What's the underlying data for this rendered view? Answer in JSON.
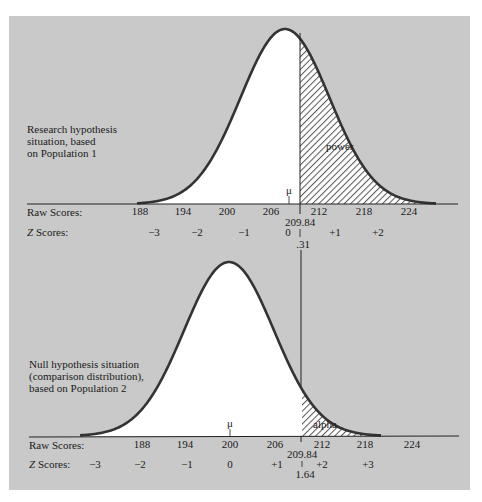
{
  "figure": {
    "background_color": "#c9c9c9",
    "curve_color": "#333333",
    "fill_color": "#ffffff",
    "hatch_color": "#555555"
  },
  "top": {
    "description": [
      "Research hypothesis",
      "situation, based",
      "on Population 1"
    ],
    "shaded_label": "power",
    "mu_label": "μ",
    "raw_label": "Raw Scores:",
    "z_label_prefix": "Z",
    "z_label_suffix": " Scores:",
    "raw_ticks": [
      "188",
      "194",
      "200",
      "206",
      "212",
      "218",
      "224"
    ],
    "z_ticks": [
      "−3",
      "−2",
      "−1",
      "0",
      "+1",
      "+2"
    ],
    "cutoff_raw": "209.84",
    "cutoff_z": ".31"
  },
  "bottom": {
    "description": [
      "Null hypothesis situation",
      "(comparison distribution),",
      "based on Population 2"
    ],
    "shaded_label": "alpha",
    "mu_label": "μ",
    "raw_label": "Raw Scores:",
    "z_label_prefix": "Z",
    "z_label_suffix": " Scores:",
    "raw_ticks": [
      "188",
      "194",
      "200",
      "206",
      "212",
      "218",
      "224"
    ],
    "z_ticks": [
      "−3",
      "−2",
      "−1",
      "0",
      "+1",
      "+2",
      "+3"
    ],
    "cutoff_raw": "209.84",
    "cutoff_z": "1.64"
  },
  "chart_data": [
    {
      "type": "area",
      "title": "Research hypothesis situation, based on Population 1",
      "distribution": "normal",
      "mean_raw": 208,
      "sd_raw": 6,
      "cutoff_raw": 209.84,
      "cutoff_z": 0.31,
      "shaded_region": "right of cutoff",
      "shaded_label": "power",
      "x_raw_ticks": [
        188,
        194,
        200,
        206,
        212,
        218,
        224
      ],
      "x_z_ticks": [
        -3,
        -2,
        -1,
        0,
        1,
        2
      ],
      "xlabel": "Raw Scores / Z Scores"
    },
    {
      "type": "area",
      "title": "Null hypothesis situation (comparison distribution), based on Population 2",
      "distribution": "normal",
      "mean_raw": 200,
      "sd_raw": 6,
      "cutoff_raw": 209.84,
      "cutoff_z": 1.64,
      "shaded_region": "right of cutoff",
      "shaded_label": "alpha",
      "x_raw_ticks": [
        188,
        194,
        200,
        206,
        212,
        218,
        224
      ],
      "x_z_ticks": [
        -3,
        -2,
        -1,
        0,
        1,
        2,
        3
      ],
      "xlabel": "Raw Scores / Z Scores"
    }
  ]
}
